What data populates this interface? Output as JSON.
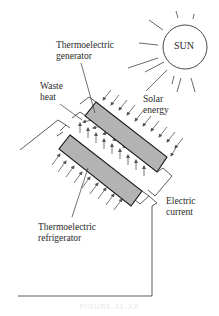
{
  "diagram": {
    "labels": {
      "sun": "SUN",
      "generator_line1": "Thermoelectric",
      "generator_line2": "generator",
      "waste_line1": "Waste",
      "waste_line2": "heat",
      "solar_line1": "Solar",
      "solar_line2": "energy",
      "electric_line1": "Electric",
      "electric_line2": "current",
      "refrigerator_line1": "Thermoelectric",
      "refrigerator_line2": "refrigerator"
    },
    "caption": "FIGURE 11-XX",
    "colors": {
      "bar_fill": "#b3b3b3",
      "stroke": "#1a1a1a",
      "arrow": "#555555",
      "text": "#2a2a2a"
    }
  }
}
